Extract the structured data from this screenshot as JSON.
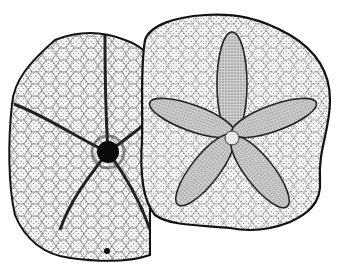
{
  "image": {
    "description": "Engraved illustration of two sand dollar (echinoid) tests: oral view with central mouth on the left, aboral view with five-petaled petaloid star on the right",
    "style": "black ink stippled engraving on white",
    "colors": {
      "background": "#ffffff",
      "ink": "#1a1a1a",
      "shade": "#d9d9d9",
      "paper": "#f4f4f4"
    },
    "subjects": [
      {
        "name": "oral-view-test",
        "features": [
          "central mouth",
          "five food grooves",
          "plate mosaic",
          "anal pore"
        ]
      },
      {
        "name": "aboral-view-test",
        "features": [
          "five petaloids",
          "apical disc",
          "plate mosaic"
        ]
      }
    ]
  }
}
